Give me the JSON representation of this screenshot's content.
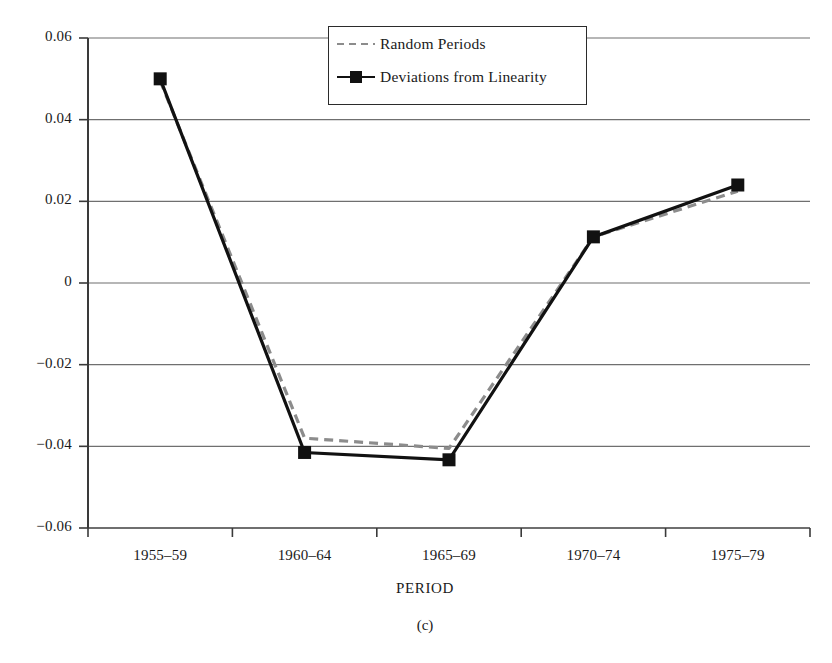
{
  "figure": {
    "panel_caption": "(c)",
    "axis_title_x": "PERIOD"
  },
  "legend": {
    "entries": [
      {
        "label": "Random Periods",
        "style": "dashed",
        "color": "#8c8c8c",
        "marker": "none"
      },
      {
        "label": "Deviations from Linearity",
        "style": "solid",
        "color": "#111111",
        "marker": "square"
      }
    ]
  },
  "chart_data": {
    "type": "line",
    "title": "",
    "xlabel": "PERIOD",
    "ylabel": "",
    "categories": [
      "1955–59",
      "1960–64",
      "1965–69",
      "1970–74",
      "1975–79"
    ],
    "ylim": [
      -0.06,
      0.06
    ],
    "yticks": [
      0.06,
      0.04,
      0.02,
      0,
      -0.02,
      -0.04,
      -0.06
    ],
    "ytick_labels": [
      "0.06",
      "0.04",
      "0.02",
      "0",
      "−0.02",
      "−0.04",
      "−0.06"
    ],
    "grid": true,
    "legend_position": "top-center",
    "series": [
      {
        "name": "Random Periods",
        "values": [
          0.0495,
          -0.038,
          -0.0405,
          0.0113,
          0.0225
        ]
      },
      {
        "name": "Deviations from Linearity",
        "values": [
          0.05,
          -0.0415,
          -0.0433,
          0.0113,
          0.024
        ]
      }
    ]
  }
}
